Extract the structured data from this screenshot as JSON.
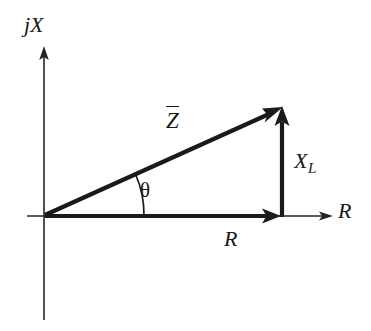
{
  "figure": {
    "kind": "impedance-phasor-diagram",
    "width": 371,
    "height": 331,
    "background_color": "#ffffff",
    "line_color": "#1a1a1a",
    "axis_color": "#262626"
  },
  "axes": {
    "vertical": {
      "label": "jX",
      "x": 44,
      "top": 50,
      "bottom": 320
    },
    "horizontal": {
      "label": "R",
      "y": 216,
      "left": 27,
      "right": 330
    },
    "origin": {
      "x": 44,
      "y": 216
    }
  },
  "vectors": [
    {
      "name": "impedance",
      "label": "Z",
      "has_overbar": true,
      "from": {
        "x": 44,
        "y": 216
      },
      "to": {
        "x": 278,
        "y": 110
      },
      "label_pos": {
        "x": 166,
        "y": 106
      }
    },
    {
      "name": "resistance",
      "label": "R",
      "has_overbar": false,
      "from": {
        "x": 44,
        "y": 216
      },
      "to": {
        "x": 278,
        "y": 216
      },
      "label_pos": {
        "x": 224,
        "y": 228
      }
    },
    {
      "name": "inductive-reactance",
      "label": "X",
      "subscript": "L",
      "has_overbar": false,
      "from": {
        "x": 282,
        "y": 216
      },
      "to": {
        "x": 282,
        "y": 110
      },
      "label_pos": {
        "x": 294,
        "y": 150
      }
    }
  ],
  "angle": {
    "label": "θ",
    "name": "impedance-angle",
    "vertex": {
      "x": 44,
      "y": 216
    },
    "radius": 100,
    "label_pos": {
      "x": 140,
      "y": 180
    },
    "degrees": 24
  },
  "labels": {
    "axis_vertical": "jX",
    "axis_horizontal": "R",
    "vector_z": "Z",
    "vector_r": "R",
    "vector_x": "X",
    "vector_x_subscript": "L",
    "angle_theta": "θ"
  }
}
